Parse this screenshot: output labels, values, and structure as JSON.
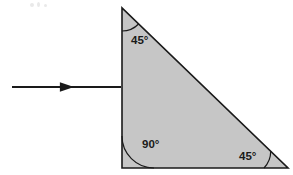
{
  "figure": {
    "title": "Right isosceles triangular prism with incident ray",
    "background_color": "#ffffff",
    "width": 293,
    "height": 175
  },
  "shape": {
    "name": "right-triangle",
    "fill_color": "#c6c6c6",
    "stroke_color": "#1a1a1a",
    "stroke_width": 1.6,
    "vertices": {
      "top": {
        "x": 122,
        "y": 8
      },
      "bottom_left": {
        "x": 122,
        "y": 168
      },
      "bottom_right": {
        "x": 288,
        "y": 168
      }
    }
  },
  "angles": [
    {
      "id": "top-angle",
      "value": "45",
      "degree_symbol": "°",
      "label": "45°",
      "vertex": "top",
      "arc_radius": 23,
      "label_x": 131,
      "label_y": 44
    },
    {
      "id": "bottom-left-angle",
      "value": "90",
      "degree_symbol": "°",
      "label": "90°",
      "vertex": "bottom_left",
      "arc_radius": 32,
      "label_x": 142,
      "label_y": 148
    },
    {
      "id": "bottom-right-angle",
      "value": "45",
      "degree_symbol": "°",
      "label": "45°",
      "vertex": "bottom_right",
      "arc_radius": 24,
      "label_x": 239,
      "label_y": 160
    }
  ],
  "ray": {
    "name": "incident-ray",
    "direction": "right",
    "color": "#1a1a1a",
    "stroke_width": 1.8,
    "start_x": 12,
    "end_x": 121,
    "y": 87,
    "arrowhead_x": 68,
    "arrowhead_size": 6
  }
}
